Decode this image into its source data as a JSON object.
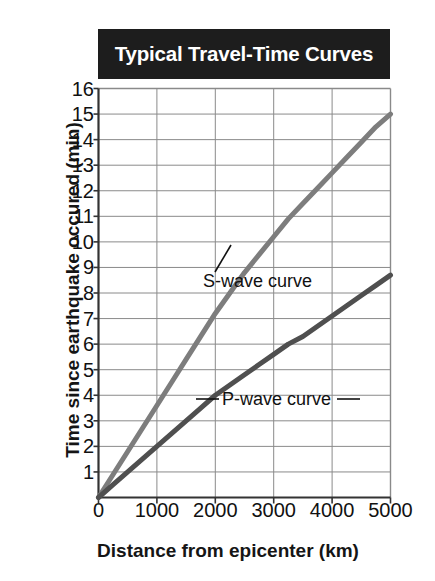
{
  "chart_data": {
    "type": "line",
    "title": "Typical Travel-Time Curves",
    "xlabel": "Distance from epicenter (km)",
    "ylabel": "Time since earthquake occured (min)",
    "xlim": [
      0,
      5000
    ],
    "ylim": [
      0,
      16
    ],
    "grid": true,
    "legend_position": "inline-annotations",
    "x_ticks": [
      0,
      1000,
      2000,
      3000,
      4000,
      5000
    ],
    "x_tick_labels": [
      "0",
      "1000",
      "2000",
      "3000",
      "4000",
      "5000"
    ],
    "y_ticks": [
      0,
      1,
      2,
      3,
      4,
      5,
      6,
      7,
      8,
      9,
      10,
      11,
      12,
      13,
      14,
      15,
      16
    ],
    "y_tick_labels": [
      "0",
      "1",
      "2",
      "3",
      "4",
      "5",
      "6",
      "7",
      "8",
      "9",
      "10",
      "11",
      "12",
      "13",
      "14",
      "15",
      "16"
    ],
    "x": [
      0,
      250,
      500,
      750,
      1000,
      1250,
      1500,
      1750,
      2000,
      2250,
      2500,
      2750,
      3000,
      3250,
      3500,
      3750,
      4000,
      4250,
      4500,
      4750,
      5000
    ],
    "series": [
      {
        "name": "S-wave curve",
        "color": "#7d7d7d",
        "values": [
          0,
          0.9,
          1.8,
          2.7,
          3.6,
          4.5,
          5.4,
          6.3,
          7.2,
          8.0,
          8.8,
          9.5,
          10.2,
          10.9,
          11.5,
          12.1,
          12.7,
          13.3,
          13.9,
          14.5,
          15.0
        ]
      },
      {
        "name": "P-wave curve",
        "color": "#4f4f4f",
        "values": [
          0,
          0.5,
          1.0,
          1.5,
          2.0,
          2.5,
          3.0,
          3.5,
          4.0,
          4.4,
          4.8,
          5.2,
          5.6,
          6.0,
          6.3,
          6.7,
          7.1,
          7.5,
          7.9,
          8.3,
          8.7
        ]
      }
    ],
    "annotations": [
      {
        "text": "S-wave curve",
        "x": 2600,
        "y": 8.6
      },
      {
        "text": "P-wave curve",
        "x": 3050,
        "y": 4.6
      }
    ]
  },
  "chart": {
    "title": "Typical Travel-Time Curves",
    "x_axis_title": "Distance from epicenter (km)",
    "y_axis_title": "Time since earthquake occured (min)",
    "s_wave_label": "S-wave curve",
    "p_wave_label": "P-wave curve",
    "colors": {
      "banner_background": "#1d1d1d",
      "banner_text": "#ffffff",
      "s_wave": "#7d7d7d",
      "p_wave": "#4f4f4f",
      "grid": "#8a8a8a",
      "axis": "#333333",
      "text": "#111111"
    }
  }
}
